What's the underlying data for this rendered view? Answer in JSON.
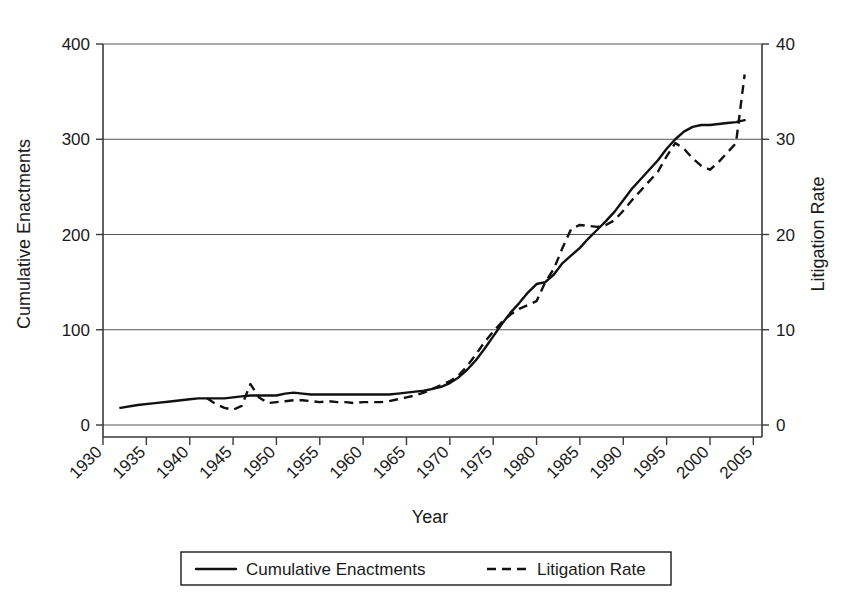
{
  "chart_data": {
    "type": "line",
    "title": "",
    "xlabel": "Year",
    "ylabel": "Cumulative Enactments",
    "y2label": "Litigation Rate",
    "xlim": [
      1930,
      2006
    ],
    "ylim": [
      0,
      400
    ],
    "y2lim": [
      0,
      40
    ],
    "grid": true,
    "grid_axis": "y",
    "legend_position": "below-plot",
    "xticks": [
      1930,
      1935,
      1940,
      1945,
      1950,
      1955,
      1960,
      1965,
      1970,
      1975,
      1980,
      1985,
      1990,
      1995,
      2000,
      2005
    ],
    "xtick_labels": [
      "1930",
      "1935",
      "1940",
      "1945",
      "1950",
      "1955",
      "1960",
      "1965",
      "1970",
      "1975",
      "1980",
      "1985",
      "1990",
      "1995",
      "2000",
      "2005"
    ],
    "xtick_rotation_deg": 45,
    "yticks": [
      0,
      100,
      200,
      300,
      400
    ],
    "ytick_labels": [
      "0",
      "100",
      "200",
      "300",
      "400"
    ],
    "y2ticks": [
      0,
      10,
      20,
      30,
      40
    ],
    "y2tick_labels": [
      "0",
      "10",
      "20",
      "30",
      "40"
    ],
    "series": [
      {
        "name": "Cumulative Enactments",
        "style": "solid",
        "axis": "left",
        "color": "#111111",
        "x": [
          1932,
          1934,
          1936,
          1938,
          1940,
          1941,
          1942,
          1943,
          1944,
          1945,
          1946,
          1947,
          1948,
          1949,
          1950,
          1951,
          1952,
          1953,
          1954,
          1955,
          1956,
          1957,
          1958,
          1959,
          1960,
          1961,
          1962,
          1963,
          1964,
          1965,
          1966,
          1967,
          1968,
          1969,
          1970,
          1971,
          1972,
          1973,
          1974,
          1975,
          1976,
          1977,
          1978,
          1979,
          1980,
          1981,
          1982,
          1983,
          1984,
          1985,
          1986,
          1987,
          1988,
          1989,
          1990,
          1991,
          1992,
          1993,
          1994,
          1995,
          1996,
          1997,
          1998,
          1999,
          2000,
          2001,
          2002,
          2003,
          2004
        ],
        "y": [
          18,
          21,
          23,
          25,
          27,
          28,
          28,
          28,
          28,
          29,
          30,
          31,
          31,
          31,
          31,
          33,
          34,
          33,
          32,
          32,
          32,
          32,
          32,
          32,
          32,
          32,
          32,
          32,
          33,
          34,
          35,
          36,
          38,
          40,
          44,
          50,
          58,
          68,
          80,
          93,
          106,
          118,
          128,
          139,
          148,
          150,
          158,
          170,
          178,
          186,
          196,
          205,
          214,
          224,
          236,
          248,
          258,
          268,
          278,
          290,
          300,
          308,
          313,
          315,
          315,
          316,
          317,
          318,
          320
        ]
      },
      {
        "name": "Litigation Rate",
        "style": "dashed",
        "axis": "right",
        "color": "#111111",
        "x": [
          1942,
          1943,
          1944,
          1945,
          1946,
          1947,
          1948,
          1949,
          1950,
          1951,
          1952,
          1953,
          1954,
          1955,
          1956,
          1957,
          1958,
          1959,
          1960,
          1961,
          1962,
          1963,
          1964,
          1965,
          1966,
          1967,
          1968,
          1969,
          1970,
          1971,
          1972,
          1973,
          1974,
          1975,
          1976,
          1977,
          1978,
          1979,
          1980,
          1981,
          1982,
          1983,
          1984,
          1985,
          1986,
          1987,
          1988,
          1989,
          1990,
          1991,
          1992,
          1993,
          1994,
          1995,
          1996,
          1997,
          1998,
          1999,
          2000,
          2001,
          2002,
          2003,
          2004
        ],
        "y": [
          2.8,
          2.2,
          1.8,
          1.6,
          2.0,
          4.3,
          2.9,
          2.3,
          2.4,
          2.5,
          2.6,
          2.6,
          2.5,
          2.4,
          2.5,
          2.4,
          2.4,
          2.3,
          2.4,
          2.4,
          2.4,
          2.5,
          2.7,
          2.9,
          3.1,
          3.4,
          3.8,
          4.2,
          4.6,
          5.2,
          6.2,
          7.4,
          8.7,
          9.8,
          10.8,
          11.6,
          12.2,
          12.6,
          13.0,
          15.0,
          16.4,
          18.6,
          20.6,
          21.0,
          20.9,
          20.8,
          21.0,
          21.5,
          22.5,
          23.6,
          24.6,
          25.6,
          26.6,
          28.2,
          29.6,
          29.0,
          28.0,
          27.2,
          26.8,
          27.6,
          28.6,
          29.6,
          36.8
        ]
      }
    ]
  },
  "axes": {
    "left_title": "Cumulative Enactments",
    "right_title": "Litigation Rate",
    "bottom_title": "Year"
  },
  "legend": {
    "items": [
      {
        "label": "Cumulative Enactments",
        "style": "solid"
      },
      {
        "label": "Litigation Rate",
        "style": "dashed"
      }
    ]
  }
}
